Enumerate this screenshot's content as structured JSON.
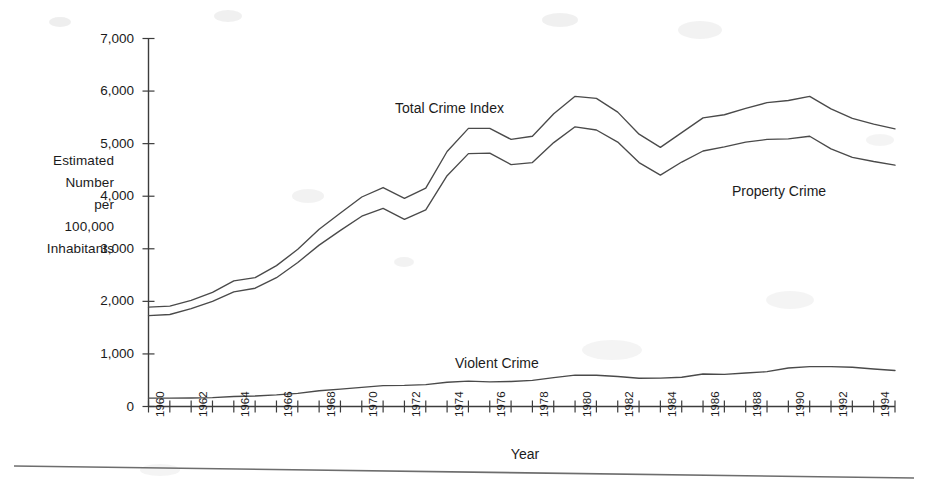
{
  "chart_data": {
    "type": "line",
    "title": "",
    "xlabel": "Year",
    "ylabel": "Estimated\nNumber\nper\n100,000\nInhabitants",
    "ylim": [
      0,
      7000
    ],
    "xlim": [
      1960,
      1995
    ],
    "grid": false,
    "legend_position": "inline-annotations",
    "ytick_labels": [
      "0",
      "1,000",
      "2,000",
      "3,000",
      "4,000",
      "5,000",
      "6,000",
      "7,000"
    ],
    "ytick_values": [
      0,
      1000,
      2000,
      3000,
      4000,
      5000,
      6000,
      7000
    ],
    "xtick_labels": [
      "1960",
      "1962",
      "1964",
      "1966",
      "1968",
      "1970",
      "1972",
      "1974",
      "1976",
      "1978",
      "1980",
      "1982",
      "1984",
      "1986",
      "1988",
      "1990",
      "1992",
      "1994"
    ],
    "xtick_values": [
      1960,
      1962,
      1964,
      1966,
      1968,
      1970,
      1972,
      1974,
      1976,
      1978,
      1980,
      1982,
      1984,
      1986,
      1988,
      1990,
      1992,
      1994
    ],
    "x": [
      1960,
      1961,
      1962,
      1963,
      1964,
      1965,
      1966,
      1967,
      1968,
      1969,
      1970,
      1971,
      1972,
      1973,
      1974,
      1975,
      1976,
      1977,
      1978,
      1979,
      1980,
      1981,
      1982,
      1983,
      1984,
      1985,
      1986,
      1987,
      1988,
      1989,
      1990,
      1991,
      1992,
      1993,
      1994,
      1995
    ],
    "series": [
      {
        "name": "Total Crime Index",
        "color": "#4a4a4a",
        "values": [
          1890,
          1910,
          2020,
          2170,
          2390,
          2450,
          2680,
          2990,
          3370,
          3680,
          3985,
          4165,
          3960,
          4155,
          4850,
          5290,
          5290,
          5080,
          5140,
          5570,
          5900,
          5860,
          5600,
          5180,
          4930,
          5210,
          5490,
          5550,
          5670,
          5780,
          5820,
          5900,
          5660,
          5480,
          5370,
          5280
        ],
        "peak_year": 1980,
        "peak_value": 5900
      },
      {
        "name": "Property Crime",
        "color": "#4a4a4a",
        "values": [
          1730,
          1750,
          1860,
          2000,
          2180,
          2250,
          2450,
          2740,
          3070,
          3350,
          3620,
          3770,
          3560,
          3740,
          4390,
          4810,
          4820,
          4600,
          4640,
          5020,
          5320,
          5260,
          5030,
          4640,
          4400,
          4650,
          4860,
          4940,
          5030,
          5080,
          5090,
          5140,
          4900,
          4740,
          4660,
          4590
        ],
        "peak_year": 1980,
        "peak_value": 5320
      },
      {
        "name": "Violent Crime",
        "color": "#4a4a4a",
        "values": [
          160,
          160,
          162,
          168,
          190,
          200,
          220,
          250,
          300,
          330,
          364,
          396,
          401,
          417,
          461,
          482,
          468,
          476,
          498,
          549,
          597,
          594,
          571,
          538,
          539,
          557,
          618,
          610,
          637,
          663,
          732,
          758,
          758,
          747,
          714,
          685
        ],
        "peak_year": 1991,
        "peak_value": 758
      }
    ],
    "annotations": [
      {
        "text": "Total Crime Index",
        "x_px": 395,
        "y_px": 100
      },
      {
        "text": "Property Crime",
        "x_px": 732,
        "y_px": 183
      },
      {
        "text": "Violent Crime",
        "x_px": 455,
        "y_px": 355
      }
    ]
  },
  "axis": {
    "y_title_lines": "Estimated\nNumber\nper\n100,000\nInhabitants",
    "x_title": "Year"
  }
}
